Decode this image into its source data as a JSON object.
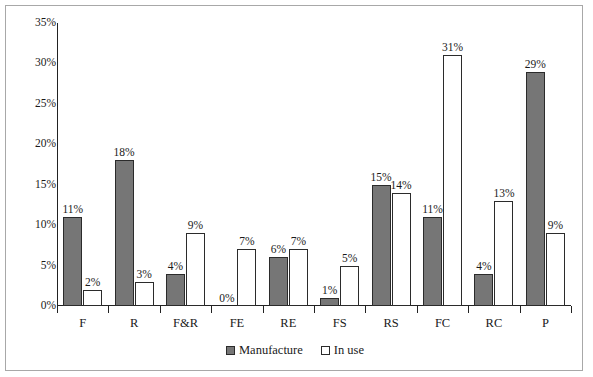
{
  "chart_data": {
    "type": "bar",
    "title": "",
    "subtitle": "",
    "xlabel": "",
    "ylabel": "",
    "categories": [
      "F",
      "R",
      "F&R",
      "FE",
      "RE",
      "FS",
      "RS",
      "FC",
      "RC",
      "P"
    ],
    "series": [
      {
        "name": "Manufacture",
        "color": "#767676",
        "values": [
          11,
          18,
          4,
          0,
          6,
          1,
          15,
          11,
          4,
          29
        ],
        "labels": [
          "11%",
          "18%",
          "4%",
          "0%",
          "6%",
          "1%",
          "15%",
          "11%",
          "4%",
          "29%"
        ]
      },
      {
        "name": "In use",
        "color": "#ffffff",
        "values": [
          2,
          3,
          9,
          7,
          7,
          5,
          14,
          31,
          13,
          9
        ],
        "labels": [
          "2%",
          "3%",
          "9%",
          "7%",
          "7%",
          "5%",
          "14%",
          "31%",
          "13%",
          "9%"
        ]
      }
    ],
    "ylim": [
      0,
      35
    ],
    "ytick_values": [
      0,
      5,
      10,
      15,
      20,
      25,
      30,
      35
    ],
    "ytick_labels": [
      "0%",
      "5%",
      "10%",
      "15%",
      "20%",
      "25%",
      "30%",
      "35%"
    ],
    "grid": false,
    "legend_position": "bottom-center",
    "value_labels_shown": true
  },
  "legend": {
    "items": [
      {
        "label": "Manufacture",
        "swatch": "filled-gray-square"
      },
      {
        "label": "In use",
        "swatch": "outlined-white-square"
      }
    ]
  }
}
